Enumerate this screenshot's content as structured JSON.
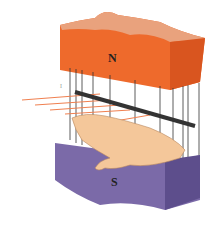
{
  "figure": {
    "north_pole_label": "N",
    "south_pole_label": "S",
    "current_label": "I",
    "colors": {
      "north_front": "#ee6a2c",
      "north_top": "#e9a27d",
      "north_side": "#d9551f",
      "south_front": "#7b6aa8",
      "south_top": "#9484bd",
      "south_side": "#5d4e8c",
      "field_lines": "#333333",
      "conductor": "#333333",
      "current_arrows": "#f08050",
      "hand": "#f4c79a"
    }
  }
}
